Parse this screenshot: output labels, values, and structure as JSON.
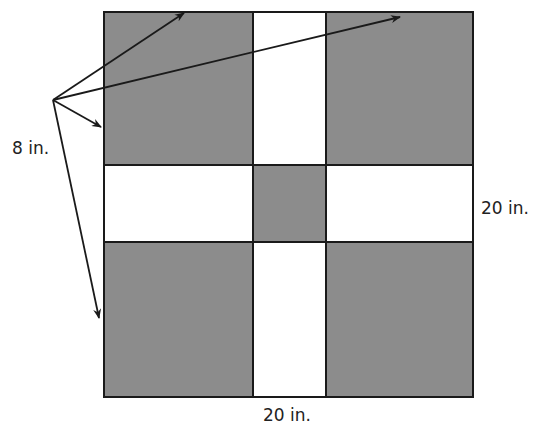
{
  "diagram": {
    "colors": {
      "shaded": "#8c8c8c",
      "unshaded": "#ffffff",
      "stroke": "#1a1a1a"
    },
    "outer_square": {
      "width_label": "20 in.",
      "height_label": "20 in."
    },
    "corner_square_label": "8 in.",
    "labels": {
      "corner_size": "8 in.",
      "right_side": "20 in.",
      "bottom_side": "20 in."
    },
    "grid": {
      "rows": [
        [
          "shaded",
          "white",
          "shaded"
        ],
        [
          "white",
          "shaded",
          "white"
        ],
        [
          "shaded",
          "white",
          "shaded"
        ]
      ]
    },
    "arrows": [
      {
        "target": "top edge of top-left square"
      },
      {
        "target": "top edge of top-right square"
      },
      {
        "target": "left edge of top-left square"
      },
      {
        "target": "left edge of bottom-left square"
      }
    ]
  }
}
